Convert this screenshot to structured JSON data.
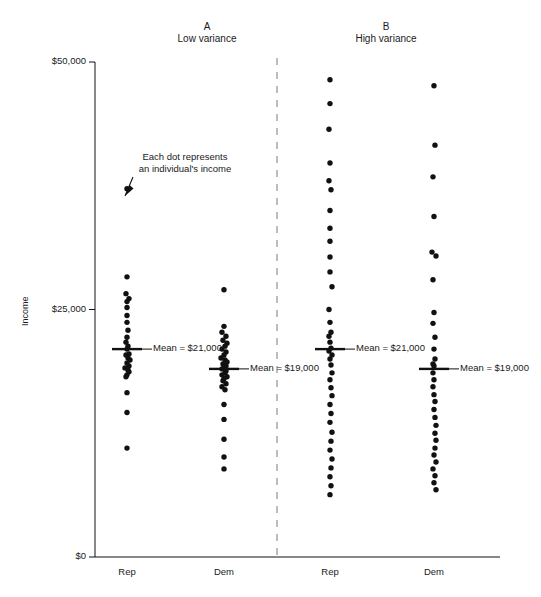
{
  "figure": {
    "width": 541,
    "height": 597,
    "background": "#ffffff",
    "ink_color": "#111111",
    "divider_color": "#9a9a9a"
  },
  "annotations": {
    "dot_note_line1": "Each dot represents",
    "dot_note_line2": "an individual's income"
  },
  "panels": [
    {
      "id": "A",
      "letter": "A",
      "subtitle": "Low variance",
      "groups": [
        {
          "label": "Rep",
          "mean_label": "Mean = $21,000",
          "mean_value": 21000
        },
        {
          "label": "Dem",
          "mean_label": "Mean = $19,000",
          "mean_value": 19000
        }
      ]
    },
    {
      "id": "B",
      "letter": "B",
      "subtitle": "High variance",
      "groups": [
        {
          "label": "Rep",
          "mean_label": "Mean = $21,000",
          "mean_value": 21000
        },
        {
          "label": "Dem",
          "mean_label": "Mean = $19,000",
          "mean_value": 19000
        }
      ]
    }
  ],
  "chart_data": {
    "type": "scatter",
    "title": "",
    "xlabel": "",
    "ylabel": "Income",
    "ylim": [
      0,
      50000
    ],
    "yticks": [
      0,
      25000,
      50000
    ],
    "ytick_labels": [
      "$0",
      "$25,000",
      "$50,000"
    ],
    "grid": false,
    "legend": "none",
    "x_categories": [
      "Rep",
      "Dem",
      "Rep",
      "Dem"
    ],
    "panel_divider": true,
    "series": [
      {
        "name": "A / Rep",
        "panel": "A",
        "group": "Rep",
        "mean": 21000,
        "n": 27,
        "values": [
          37200,
          28300,
          26600,
          26100,
          25800,
          25200,
          24400,
          23700,
          22900,
          22200,
          21700,
          21000,
          20500,
          20400,
          20100,
          19900,
          19600,
          19300,
          19100,
          18900,
          18700,
          18400,
          18200,
          16600,
          14600,
          11000,
          21300
        ],
        "x_jitter": [
          0,
          0,
          -1,
          2,
          0,
          0,
          0,
          0,
          1,
          0,
          -1,
          0,
          2,
          -1,
          1,
          3,
          0,
          2,
          -2,
          1,
          2,
          0,
          -1,
          0,
          0,
          0,
          1
        ]
      },
      {
        "name": "A / Dem",
        "panel": "A",
        "group": "Dem",
        "mean": 19000,
        "n": 31,
        "values": [
          27000,
          23300,
          22700,
          22300,
          21900,
          21600,
          21300,
          21000,
          20700,
          20400,
          20100,
          19900,
          19700,
          19500,
          19300,
          19100,
          19000,
          18800,
          18600,
          18400,
          18200,
          18000,
          17800,
          17500,
          17200,
          16900,
          15400,
          13900,
          11900,
          10100,
          8900
        ],
        "x_jitter": [
          0,
          0,
          -2,
          2,
          -1,
          3,
          1,
          -2,
          2,
          0,
          -3,
          1,
          3,
          -1,
          2,
          0,
          -2,
          2,
          1,
          -2,
          3,
          0,
          -1,
          2,
          -2,
          1,
          0,
          0,
          0,
          0,
          0
        ]
      },
      {
        "name": "B / Rep",
        "panel": "B",
        "group": "Rep",
        "mean": 21000,
        "n": 37,
        "values": [
          48200,
          45800,
          43200,
          39800,
          38000,
          37100,
          35000,
          33200,
          31900,
          30300,
          28800,
          27300,
          25000,
          23700,
          22700,
          22300,
          21700,
          21100,
          20800,
          20400,
          20000,
          19400,
          18600,
          17900,
          17100,
          16300,
          15400,
          14500,
          13600,
          12600,
          11700,
          10800,
          9900,
          9000,
          8100,
          7200,
          6300
        ],
        "x_jitter": [
          0,
          0,
          -1,
          0,
          -1,
          1,
          0,
          0,
          0,
          0,
          0,
          2,
          -1,
          0,
          1,
          -1,
          0,
          1,
          -1,
          2,
          0,
          1,
          2,
          0,
          1,
          2,
          0,
          1,
          0,
          2,
          1,
          0,
          2,
          1,
          0,
          1,
          0
        ]
      },
      {
        "name": "B / Dem",
        "panel": "B",
        "group": "Dem",
        "mean": 19000,
        "n": 31,
        "values": [
          47600,
          41600,
          38400,
          34400,
          30800,
          30400,
          28000,
          24700,
          23600,
          22200,
          21000,
          20000,
          19500,
          19300,
          18600,
          17900,
          17200,
          16400,
          15700,
          14900,
          14100,
          13300,
          12500,
          11800,
          11000,
          10300,
          9600,
          8900,
          8200,
          7500,
          6800
        ],
        "x_jitter": [
          0,
          1,
          -1,
          0,
          -2,
          2,
          -1,
          0,
          -1,
          1,
          0,
          1,
          -1,
          0,
          -1,
          0,
          -1,
          0,
          1,
          0,
          1,
          2,
          1,
          2,
          1,
          0,
          2,
          -1,
          1,
          0,
          2
        ]
      }
    ]
  }
}
